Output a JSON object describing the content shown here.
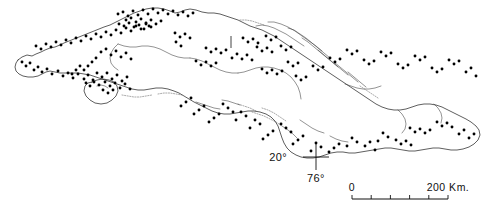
{
  "map": {
    "title": "Distribution map of Cuba",
    "region": "Cuba",
    "background_color": "#ffffff",
    "coastline_color": "#1a1a1a",
    "dot_color": "#000000",
    "graticule": {
      "latitude_label": "20°",
      "longitude_label": "76°",
      "cross_x": 316,
      "cross_y": 157,
      "arm_length": 13
    },
    "scale_bar": {
      "start_label": "0",
      "end_label": "200 Km.",
      "units": "Km.",
      "max_value": 200,
      "tick_count": 4,
      "x_start": 352,
      "x_end": 448,
      "y": 199
    },
    "meridian_tick": {
      "x": 231,
      "y_top": 36,
      "y_bottom": 48
    }
  },
  "chart_data": {
    "type": "scatter",
    "xlabel": "",
    "ylabel": "",
    "legend": [],
    "locality_count": 178,
    "points": [
      [
        22,
        62
      ],
      [
        26,
        66
      ],
      [
        30,
        63
      ],
      [
        34,
        70
      ],
      [
        38,
        67
      ],
      [
        42,
        72
      ],
      [
        47,
        69
      ],
      [
        52,
        74
      ],
      [
        58,
        71
      ],
      [
        63,
        76
      ],
      [
        68,
        73
      ],
      [
        73,
        78
      ],
      [
        78,
        74
      ],
      [
        84,
        79
      ],
      [
        88,
        75
      ],
      [
        93,
        80
      ],
      [
        36,
        46
      ],
      [
        41,
        49
      ],
      [
        46,
        44
      ],
      [
        51,
        47
      ],
      [
        56,
        42
      ],
      [
        61,
        45
      ],
      [
        66,
        40
      ],
      [
        71,
        43
      ],
      [
        76,
        38
      ],
      [
        81,
        41
      ],
      [
        86,
        36
      ],
      [
        91,
        39
      ],
      [
        96,
        34
      ],
      [
        101,
        37
      ],
      [
        106,
        32
      ],
      [
        111,
        35
      ],
      [
        116,
        30
      ],
      [
        121,
        33
      ],
      [
        126,
        28
      ],
      [
        131,
        31
      ],
      [
        136,
        26
      ],
      [
        141,
        29
      ],
      [
        146,
        24
      ],
      [
        151,
        27
      ],
      [
        118,
        14
      ],
      [
        123,
        12
      ],
      [
        128,
        16
      ],
      [
        133,
        11
      ],
      [
        138,
        15
      ],
      [
        143,
        10
      ],
      [
        148,
        14
      ],
      [
        153,
        9
      ],
      [
        158,
        13
      ],
      [
        163,
        10
      ],
      [
        168,
        14
      ],
      [
        173,
        11
      ],
      [
        178,
        15
      ],
      [
        183,
        12
      ],
      [
        188,
        16
      ],
      [
        193,
        13
      ],
      [
        126,
        20
      ],
      [
        131,
        18
      ],
      [
        136,
        22
      ],
      [
        141,
        19
      ],
      [
        146,
        23
      ],
      [
        151,
        20
      ],
      [
        156,
        24
      ],
      [
        161,
        21
      ],
      [
        119,
        24
      ],
      [
        124,
        26
      ],
      [
        129,
        23
      ],
      [
        134,
        27
      ],
      [
        139,
        25
      ],
      [
        144,
        29
      ],
      [
        149,
        26
      ],
      [
        101,
        52
      ],
      [
        106,
        49
      ],
      [
        111,
        55
      ],
      [
        116,
        51
      ],
      [
        121,
        57
      ],
      [
        126,
        53
      ],
      [
        131,
        59
      ],
      [
        96,
        58
      ],
      [
        92,
        62
      ],
      [
        88,
        66
      ],
      [
        84,
        70
      ],
      [
        80,
        66
      ],
      [
        76,
        70
      ],
      [
        72,
        74
      ],
      [
        97,
        73
      ],
      [
        102,
        77
      ],
      [
        107,
        73
      ],
      [
        112,
        79
      ],
      [
        117,
        75
      ],
      [
        122,
        81
      ],
      [
        127,
        77
      ],
      [
        105,
        82
      ],
      [
        110,
        86
      ],
      [
        115,
        83
      ],
      [
        120,
        88
      ],
      [
        125,
        84
      ],
      [
        130,
        89
      ],
      [
        99,
        85
      ],
      [
        94,
        82
      ],
      [
        90,
        86
      ],
      [
        86,
        83
      ],
      [
        103,
        90
      ],
      [
        108,
        93
      ],
      [
        113,
        90
      ],
      [
        175,
        33
      ],
      [
        180,
        37
      ],
      [
        185,
        34
      ],
      [
        190,
        38
      ],
      [
        176,
        42
      ],
      [
        181,
        46
      ],
      [
        206,
        48
      ],
      [
        211,
        52
      ],
      [
        216,
        49
      ],
      [
        221,
        53
      ],
      [
        226,
        50
      ],
      [
        196,
        61
      ],
      [
        201,
        65
      ],
      [
        206,
        62
      ],
      [
        211,
        66
      ],
      [
        216,
        63
      ],
      [
        232,
        58
      ],
      [
        237,
        54
      ],
      [
        242,
        59
      ],
      [
        247,
        55
      ],
      [
        252,
        60
      ],
      [
        257,
        47
      ],
      [
        262,
        51
      ],
      [
        267,
        48
      ],
      [
        272,
        52
      ],
      [
        243,
        38
      ],
      [
        248,
        42
      ],
      [
        253,
        39
      ],
      [
        258,
        43
      ],
      [
        266,
        36
      ],
      [
        271,
        40
      ],
      [
        276,
        37
      ],
      [
        281,
        46
      ],
      [
        286,
        50
      ],
      [
        291,
        47
      ],
      [
        262,
        69
      ],
      [
        267,
        73
      ],
      [
        272,
        70
      ],
      [
        277,
        74
      ],
      [
        282,
        71
      ],
      [
        288,
        62
      ],
      [
        293,
        66
      ],
      [
        298,
        63
      ],
      [
        296,
        76
      ],
      [
        301,
        80
      ],
      [
        306,
        77
      ],
      [
        313,
        66
      ],
      [
        318,
        70
      ],
      [
        323,
        67
      ],
      [
        330,
        58
      ],
      [
        335,
        62
      ],
      [
        340,
        59
      ],
      [
        347,
        50
      ],
      [
        352,
        54
      ],
      [
        357,
        51
      ],
      [
        364,
        60
      ],
      [
        369,
        64
      ],
      [
        374,
        61
      ],
      [
        381,
        52
      ],
      [
        386,
        56
      ],
      [
        391,
        53
      ],
      [
        398,
        64
      ],
      [
        403,
        68
      ],
      [
        408,
        65
      ],
      [
        415,
        56
      ],
      [
        420,
        60
      ],
      [
        425,
        57
      ],
      [
        432,
        68
      ],
      [
        437,
        72
      ],
      [
        442,
        69
      ],
      [
        449,
        60
      ],
      [
        454,
        64
      ],
      [
        459,
        61
      ],
      [
        466,
        72
      ],
      [
        471,
        68
      ],
      [
        476,
        76
      ],
      [
        410,
        128
      ],
      [
        415,
        132
      ],
      [
        420,
        129
      ],
      [
        425,
        133
      ],
      [
        430,
        130
      ],
      [
        437,
        122
      ],
      [
        442,
        126
      ],
      [
        447,
        123
      ],
      [
        452,
        127
      ],
      [
        459,
        134
      ],
      [
        464,
        130
      ],
      [
        469,
        138
      ],
      [
        474,
        134
      ],
      [
        396,
        140
      ],
      [
        401,
        144
      ],
      [
        406,
        141
      ],
      [
        411,
        145
      ],
      [
        383,
        133
      ],
      [
        388,
        137
      ],
      [
        378,
        141
      ],
      [
        365,
        146
      ],
      [
        370,
        142
      ],
      [
        375,
        150
      ],
      [
        352,
        138
      ],
      [
        357,
        142
      ],
      [
        347,
        146
      ],
      [
        334,
        148
      ],
      [
        339,
        144
      ],
      [
        329,
        152
      ],
      [
        316,
        143
      ],
      [
        321,
        147
      ],
      [
        311,
        151
      ],
      [
        298,
        140
      ],
      [
        303,
        136
      ],
      [
        293,
        144
      ],
      [
        286,
        128
      ],
      [
        291,
        132
      ],
      [
        281,
        124
      ],
      [
        268,
        135
      ],
      [
        273,
        131
      ],
      [
        263,
        139
      ],
      [
        255,
        120
      ],
      [
        260,
        124
      ],
      [
        250,
        128
      ],
      [
        241,
        112
      ],
      [
        246,
        116
      ],
      [
        236,
        120
      ],
      [
        228,
        108
      ],
      [
        233,
        112
      ],
      [
        223,
        104
      ],
      [
        214,
        118
      ],
      [
        219,
        114
      ],
      [
        209,
        122
      ],
      [
        199,
        110
      ],
      [
        204,
        106
      ],
      [
        194,
        114
      ],
      [
        186,
        102
      ],
      [
        191,
        98
      ],
      [
        181,
        106
      ]
    ]
  }
}
